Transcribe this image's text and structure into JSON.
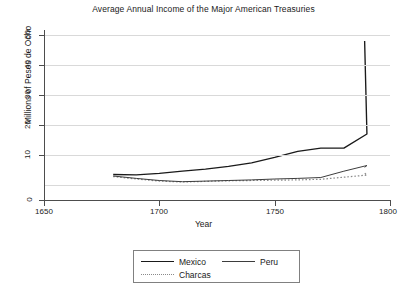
{
  "chart_data": {
    "type": "line",
    "title": "Average Annual Income of the Major American Treasuries",
    "xlabel": "Year",
    "ylabel": "Millions of Pesos de Ocho",
    "xlim": [
      1650,
      1800
    ],
    "ylim": [
      0,
      50
    ],
    "xticks": [
      1650,
      1700,
      1750,
      1800
    ],
    "yticks": [
      0,
      10,
      20,
      30,
      40,
      50
    ],
    "grid": "horizontal",
    "legend_position": "below-axes",
    "x": [
      1680,
      1690,
      1700,
      1710,
      1720,
      1730,
      1740,
      1750,
      1760,
      1770,
      1780,
      1790
    ],
    "series": [
      {
        "name": "Mexico",
        "style": "solid",
        "color": "#1a1a1a",
        "values": [
          3.5,
          3.4,
          3.9,
          4.6,
          5.3,
          6.2,
          7.4,
          9.2,
          11.2,
          12.3,
          12.3,
          17.0
        ]
      },
      {
        "name": "Peru",
        "style": "solid",
        "color": "#3d3d3d",
        "values": [
          3.0,
          2.2,
          1.5,
          1.1,
          1.3,
          1.5,
          1.7,
          2.0,
          2.2,
          2.5,
          4.6,
          6.5
        ]
      },
      {
        "name": "Charcas",
        "style": "dotted",
        "color": "#8a8a8a",
        "values": [
          2.8,
          2.0,
          1.3,
          1.0,
          1.2,
          1.4,
          1.5,
          1.6,
          1.7,
          1.9,
          2.6,
          3.3
        ]
      }
    ],
    "series_extra_points": {
      "Mexico": {
        "x": [
          1789
        ],
        "values": [
          48.0
        ]
      },
      "Peru": {
        "x": [
          1789
        ],
        "values": [
          5.9
        ]
      },
      "Charcas": {
        "x": [
          1789
        ],
        "values": [
          4.0
        ]
      }
    }
  },
  "axes": {
    "y_tick_labels": [
      "0",
      "10",
      "20",
      "30",
      "40",
      "50"
    ],
    "x_tick_labels": [
      "1650",
      "1700",
      "1750",
      "1800"
    ]
  },
  "legend": {
    "entries": [
      {
        "label": "Mexico",
        "swatch": "solid-line-swatch"
      },
      {
        "label": "Peru",
        "swatch": "solid-thin-line-swatch"
      },
      {
        "label": "Charcas",
        "swatch": "dotted-line-swatch"
      }
    ]
  }
}
